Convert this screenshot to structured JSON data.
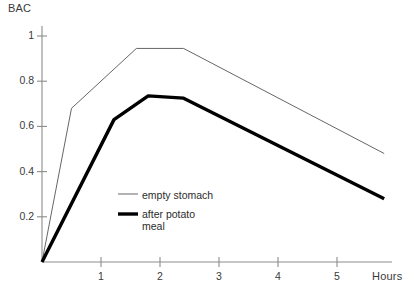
{
  "chart_data": {
    "type": "line",
    "title": "",
    "subtitle": "",
    "xlabel": "Hours",
    "ylabel": "BAC",
    "xlim": [
      0,
      5.95
    ],
    "ylim": [
      0,
      1.07
    ],
    "grid": false,
    "legend_position": "inside-lower-left",
    "x_ticks": [
      1,
      2,
      3,
      4,
      5
    ],
    "x_tick_labels": [
      "1",
      "2",
      "3",
      "4",
      "5"
    ],
    "y_ticks": [
      0.2,
      0.4,
      0.6,
      0.8,
      1
    ],
    "y_tick_labels": [
      "0.2",
      "0.4",
      "0.6",
      "0.8",
      "1"
    ],
    "series": [
      {
        "name": "empty stomach",
        "style": "thin",
        "color": "#555555",
        "line_width": 0.9,
        "points": [
          {
            "x": 0.0,
            "y": 0.0
          },
          {
            "x": 0.5,
            "y": 0.68
          },
          {
            "x": 1.6,
            "y": 0.945
          },
          {
            "x": 2.4,
            "y": 0.945
          },
          {
            "x": 5.8,
            "y": 0.48
          }
        ]
      },
      {
        "name": "after potato meal",
        "style": "thick",
        "color": "#000000",
        "line_width": 3.4,
        "points": [
          {
            "x": 0.0,
            "y": 0.0
          },
          {
            "x": 1.22,
            "y": 0.63
          },
          {
            "x": 1.8,
            "y": 0.735
          },
          {
            "x": 2.4,
            "y": 0.725
          },
          {
            "x": 5.8,
            "y": 0.28
          }
        ]
      }
    ],
    "legend": [
      {
        "label": "empty stomach",
        "style": "thin"
      },
      {
        "label": "after potato\nmeal",
        "style": "thick"
      }
    ]
  },
  "axes": {
    "y_title": "BAC",
    "x_title": "Hours",
    "axis_color": "#8c8c8c",
    "tick_color": "#8c8c8c"
  },
  "geometry": {
    "origin_x": 42,
    "origin_y": 262,
    "x_scale_px_per_hour": 59,
    "y_scale_px_per_unit": 226,
    "y_top_px": 26,
    "x_right_px": 392
  }
}
